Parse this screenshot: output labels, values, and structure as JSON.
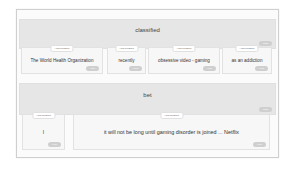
{
  "frames": [
    {
      "predicate": "classified",
      "predicate_badge": "PRED",
      "arguments": [
        {
          "tag": "ARGUMENT",
          "text": "The World Health Organization",
          "badge": "ARG0"
        },
        {
          "tag": "ARGUMENT",
          "text": "recently",
          "badge": "ARGM"
        },
        {
          "tag": "ARGUMENT",
          "text": "obsessive video - gaming",
          "badge": "ARG1"
        },
        {
          "tag": "ARGUMENT",
          "text": "as an addiction",
          "badge": "ARG2"
        }
      ]
    },
    {
      "predicate": "bet",
      "predicate_badge": "PRED",
      "arguments": [
        {
          "tag": "ARGUMENT",
          "text": "I",
          "badge": "ARG0"
        },
        {
          "tag": "ARGUMENT",
          "text": "it will not be long until gaming disorder is joined ... Netflix",
          "badge": "ARG1"
        }
      ]
    }
  ]
}
